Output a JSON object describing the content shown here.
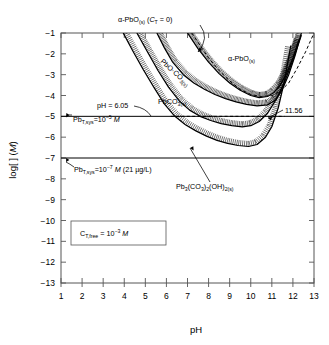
{
  "chart_data": {
    "type": "line",
    "title": "",
    "xlabel": "pH",
    "ylabel": "log[ ] (M)",
    "xlim": [
      1,
      13
    ],
    "ylim": [
      -13,
      -1
    ],
    "xticks": [
      1,
      2,
      3,
      4,
      5,
      6,
      7,
      8,
      9,
      10,
      11,
      12,
      13
    ],
    "yticks": [
      -1,
      -2,
      -3,
      -4,
      -5,
      -6,
      -7,
      -8,
      -9,
      -10,
      -11,
      -12,
      -13
    ],
    "grid": false,
    "legend_position": "none",
    "condition_box": "C_T,free = 10^-3 M",
    "series": [
      {
        "name": "alpha-PbO(s) (CT = 0)",
        "style": "dashed",
        "x": [
          7.2,
          7.6,
          8.0,
          8.5,
          9.0,
          9.5,
          10.0,
          10.5,
          11.0,
          11.4,
          11.8,
          12.2,
          12.6,
          13.0
        ],
        "y": [
          -1.0,
          -1.6,
          -2.2,
          -2.8,
          -3.3,
          -3.7,
          -3.95,
          -4.05,
          -4.0,
          -3.8,
          -3.4,
          -2.7,
          -1.9,
          -1.0
        ]
      },
      {
        "name": "PbO-CO3(s)",
        "style": "solid-hatched",
        "x": [
          5.55,
          5.9,
          6.3,
          6.8,
          7.3,
          7.8,
          8.3,
          8.8,
          9.3,
          9.8,
          10.3,
          10.8,
          11.2,
          11.5,
          11.8,
          12.1,
          12.4
        ],
        "y": [
          -1.0,
          -1.7,
          -2.4,
          -3.0,
          -3.4,
          -3.7,
          -3.95,
          -4.15,
          -4.3,
          -4.42,
          -4.5,
          -4.45,
          -4.2,
          -3.7,
          -3.0,
          -2.1,
          -1.0
        ]
      },
      {
        "name": "PbCO3(s)",
        "style": "solid-hatched",
        "x": [
          3.95,
          4.4,
          4.9,
          5.4,
          5.9,
          6.4,
          6.9,
          7.4,
          7.9,
          8.4,
          8.9,
          9.4,
          9.9,
          10.3,
          10.7,
          11.0,
          11.3,
          11.6,
          11.9
        ],
        "y": [
          -1.0,
          -1.85,
          -2.75,
          -3.6,
          -4.4,
          -5.0,
          -5.4,
          -5.7,
          -5.95,
          -6.15,
          -6.3,
          -6.4,
          -6.45,
          -6.35,
          -6.0,
          -5.5,
          -4.6,
          -3.3,
          -1.6
        ]
      },
      {
        "name": "Pb3(CO3)2(OH)2(s)",
        "style": "solid-hatched",
        "x": [
          4.6,
          5.1,
          5.6,
          6.1,
          6.6,
          7.1,
          7.6,
          8.1,
          8.6,
          9.1,
          9.6,
          10.0,
          10.4,
          10.8,
          11.2,
          11.6,
          12.0,
          12.4
        ],
        "y": [
          -1.0,
          -1.9,
          -2.8,
          -3.6,
          -4.25,
          -4.7,
          -5.0,
          -5.2,
          -5.35,
          -5.45,
          -5.5,
          -5.45,
          -5.25,
          -4.85,
          -4.2,
          -3.35,
          -2.3,
          -1.1
        ]
      },
      {
        "name": "alpha-PbO(s)",
        "style": "solid-hatched",
        "x": [
          7.0,
          7.5,
          8.0,
          8.5,
          9.0,
          9.5,
          10.0,
          10.4,
          10.8,
          11.1,
          11.4,
          11.7,
          12.0,
          12.3
        ],
        "y": [
          -1.0,
          -1.75,
          -2.4,
          -2.95,
          -3.4,
          -3.75,
          -4.0,
          -4.1,
          -4.05,
          -3.85,
          -3.5,
          -2.95,
          -2.2,
          -1.3
        ]
      }
    ],
    "reference_lines": [
      {
        "name": "Pb_T,sys = 10^-5 M",
        "value": -5,
        "style": "solid"
      },
      {
        "name": "Pb_T,sys = 10^-7 M",
        "value": -7,
        "style": "solid"
      },
      {
        "name": "dashed level -5",
        "value": -5,
        "style": "dashed"
      }
    ],
    "annotations": [
      {
        "name": "pH = 6.05",
        "x": 6.05,
        "y": -5
      },
      {
        "name": "11.56",
        "x": 11.56,
        "y": -5
      }
    ]
  },
  "axes": {
    "x_label": "pH",
    "y_label_prefix": "log[ ] (",
    "y_label_italic": "M",
    "y_label_suffix": ")",
    "x_ticks": [
      "1",
      "2",
      "3",
      "4",
      "5",
      "6",
      "7",
      "8",
      "9",
      "10",
      "11",
      "12",
      "13"
    ],
    "y_ticks": [
      "−1",
      "−2",
      "−3",
      "−4",
      "−5",
      "−6",
      "−7",
      "−8",
      "−9",
      "−10",
      "−11",
      "−12",
      "−13"
    ]
  },
  "labels": {
    "alpha_pbo_ct0": {
      "greek": "α",
      "main": "-PbO",
      "sub": "(s)",
      "tail_open": " (",
      "tail_c": "C",
      "tail_sub": "T",
      "tail_eq": " = 0)"
    },
    "alpha_pbo": {
      "greek": "α",
      "main": "-PbO",
      "sub": "(s)"
    },
    "pbo_co3": {
      "main": "PbO·CO",
      "sub3": "3",
      "subs": "(s)"
    },
    "pbco3": {
      "main": "PbCO",
      "sub": "3(s)"
    },
    "hydrocerussite": {
      "p1": "Pb",
      "s1": "3",
      "p2": "(CO",
      "s2": "3",
      "p3": ")",
      "s3": "2",
      "p4": "(OH)",
      "s4": "2(s)"
    },
    "ph_605": "pH = 6.05",
    "ph_1156": "11.56",
    "pbt_5": {
      "pre": "Pb",
      "sub": "T,sys",
      "eq": "=10",
      "exp": "−5",
      "unit": "M"
    },
    "pbt_7": {
      "pre": "Pb",
      "sub": "T,sys",
      "eq": "=10",
      "exp": "−7",
      "unit": "M",
      "paren": "(21 µg/L)"
    },
    "ct_free": {
      "pre": "C",
      "sub": "T,free",
      "eq": " = 10",
      "exp": "−3",
      "unit": "M"
    }
  },
  "colors": {
    "line": "#000000",
    "axis": "#4d4d4d",
    "background": "#ffffff"
  }
}
